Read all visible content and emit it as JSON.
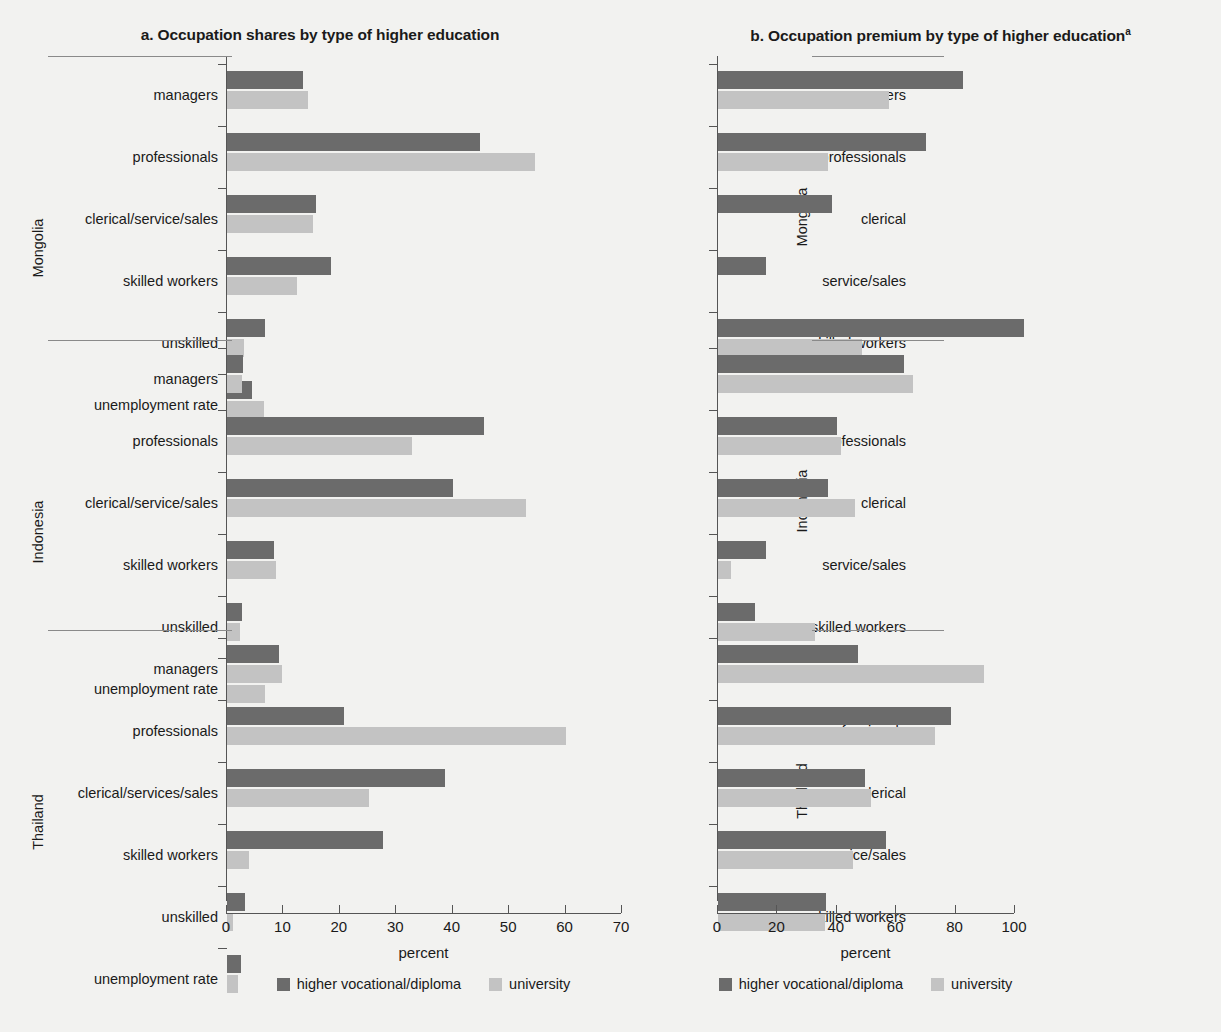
{
  "figure": {
    "background": "#f2f2f0",
    "series_colors": {
      "higher_vocational_diploma": "#6b6b6b",
      "university": "#c3c3c3"
    }
  },
  "panels": [
    {
      "id": "a",
      "title": "a. Occupation shares by type of higher education",
      "xlabel": "percent",
      "legend": [
        {
          "label": "higher vocational/diploma",
          "color": "#6b6b6b"
        },
        {
          "label": "university",
          "color": "#c3c3c3"
        }
      ],
      "xticks": [
        "0",
        "10",
        "20",
        "30",
        "40",
        "50",
        "60",
        "70"
      ]
    },
    {
      "id": "b",
      "title": "b. Occupation premium by type of higher education",
      "title_superscript": "a",
      "xlabel": "percent",
      "legend": [
        {
          "label": "higher vocational/diploma",
          "color": "#6b6b6b"
        },
        {
          "label": "university",
          "color": "#c3c3c3"
        }
      ],
      "xticks": [
        "0",
        "20",
        "40",
        "60",
        "80",
        "100"
      ]
    }
  ],
  "chart_data": [
    {
      "type": "bar",
      "orientation": "horizontal",
      "title": "a. Occupation shares by type of higher education",
      "xlabel": "percent",
      "ylabel": "",
      "xlim": [
        0,
        70
      ],
      "grid": false,
      "legend_position": "bottom",
      "series_names": [
        "higher vocational/diploma",
        "university"
      ],
      "groups": [
        {
          "name": "Mongolia",
          "categories": [
            "managers",
            "professionals",
            "clerical/service/sales",
            "skilled workers",
            "unskilled",
            "unemployment rate"
          ],
          "series": [
            {
              "name": "higher vocational/diploma",
              "values": [
                13.5,
                44.8,
                15.8,
                18.5,
                6.8,
                4.4
              ]
            },
            {
              "name": "university",
              "values": [
                14.3,
                54.5,
                15.2,
                12.4,
                3.0,
                6.6
              ]
            }
          ]
        },
        {
          "name": "Indonesia",
          "categories": [
            "managers",
            "professionals",
            "clerical/service/sales",
            "skilled workers",
            "unskilled",
            "unemployment rate"
          ],
          "series": [
            {
              "name": "higher vocational/diploma",
              "values": [
                2.8,
                45.6,
                40.0,
                8.4,
                2.6,
                7.2
              ]
            },
            {
              "name": "university",
              "values": [
                2.7,
                32.8,
                53.0,
                8.6,
                2.3,
                6.8
              ]
            }
          ]
        },
        {
          "name": "Thailand",
          "categories": [
            "managers",
            "professionals",
            "clerical/services/sales",
            "skilled workers",
            "unskilled",
            "unemployment rate"
          ],
          "series": [
            {
              "name": "higher vocational/diploma",
              "values": [
                9.3,
                20.8,
                38.7,
                27.6,
                3.2,
                2.4
              ]
            },
            {
              "name": "university",
              "values": [
                9.8,
                60.0,
                25.2,
                3.9,
                1.0,
                2.0
              ]
            }
          ]
        }
      ]
    },
    {
      "type": "bar",
      "orientation": "horizontal",
      "title": "b. Occupation premium by type of higher education",
      "xlabel": "percent",
      "ylabel": "",
      "xlim": [
        0,
        100
      ],
      "grid": false,
      "legend_position": "bottom",
      "series_names": [
        "higher vocational/diploma",
        "university"
      ],
      "groups": [
        {
          "name": "Mongolia",
          "categories": [
            "managers",
            "professionals",
            "clerical",
            "service/sales",
            "skilled workers"
          ],
          "series": [
            {
              "name": "higher vocational/diploma",
              "values": [
                82.5,
                70.0,
                38.5,
                16.0,
                103.0
              ]
            },
            {
              "name": "university",
              "values": [
                57.5,
                37.0,
                0,
                0,
                48.5
              ]
            }
          ]
        },
        {
          "name": "Indonesia",
          "categories": [
            "managers",
            "professionals",
            "clerical",
            "service/sales",
            "skilled workers"
          ],
          "series": [
            {
              "name": "higher vocational/diploma",
              "values": [
                62.5,
                40.0,
                37.0,
                16.0,
                12.5
              ]
            },
            {
              "name": "university",
              "values": [
                65.5,
                41.5,
                46.0,
                4.5,
                32.5
              ]
            }
          ]
        },
        {
          "name": "Thailand",
          "categories": [
            "managers",
            "professionals",
            "clerical",
            "service/sales",
            "skilled workers"
          ],
          "series": [
            {
              "name": "higher vocational/diploma",
              "values": [
                47.0,
                78.5,
                49.5,
                56.5,
                36.5
              ]
            },
            {
              "name": "university",
              "values": [
                89.5,
                73.0,
                51.5,
                45.5,
                36.0
              ]
            }
          ]
        }
      ]
    }
  ]
}
